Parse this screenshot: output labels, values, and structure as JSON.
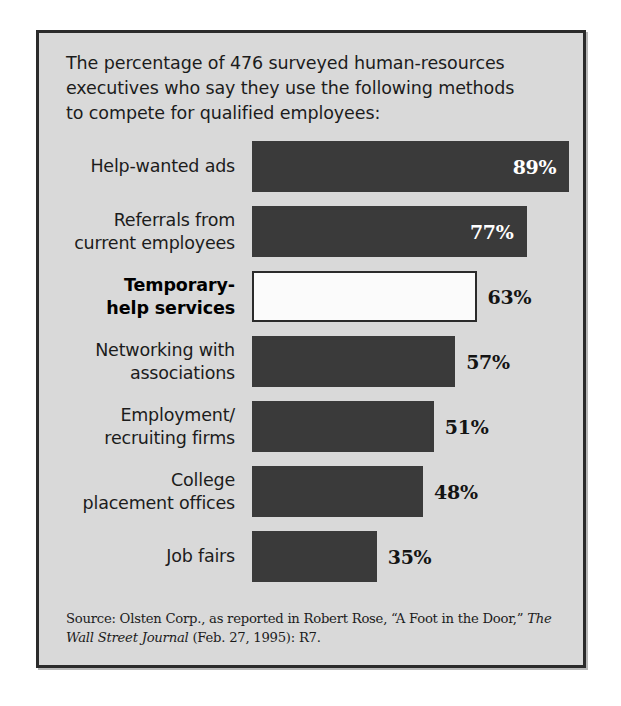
{
  "figure": {
    "caption": "The percentage of 476 surveyed human-resources executives who say they use the following methods to compete for qualified employees:",
    "source_line1": "Source: Olsten Corp., as reported in Robert Rose, “A Foot in the Door,”",
    "source_italic": "The Wall Street Journal",
    "source_line2_rest": " (Feb. 27, 1995): R7.",
    "colors": {
      "panel_background": "#d9d9d9",
      "panel_border": "#2b2b2b",
      "bar_fill": "#3a3a3a",
      "bar_highlight_fill": "#fbfbfb",
      "bar_highlight_border": "#2b2b2b",
      "value_label_inside": "#ffffff",
      "value_label_outside": "#141414",
      "text": "#1c1c1c"
    }
  },
  "chart_data": {
    "type": "bar",
    "orientation": "horizontal",
    "title": "The percentage of 476 surveyed human-resources executives who say they use the following methods to compete for qualified employees:",
    "xlabel": "",
    "ylabel": "",
    "xlim": [
      0,
      100
    ],
    "grid": false,
    "legend": null,
    "value_suffix": "%",
    "categories": [
      "Help-wanted ads",
      "Referrals from current employees",
      "Temporary-help services",
      "Networking with associations",
      "Employment/recruiting firms",
      "College placement offices",
      "Job fairs"
    ],
    "values": [
      89,
      77,
      63,
      57,
      51,
      48,
      35
    ],
    "bars": [
      {
        "label_lines": [
          "Help-wanted ads"
        ],
        "value": 89,
        "value_label": "89%",
        "highlight": false,
        "label_position": "inside"
      },
      {
        "label_lines": [
          "Referrals from",
          "current employees"
        ],
        "value": 77,
        "value_label": "77%",
        "highlight": false,
        "label_position": "inside"
      },
      {
        "label_lines": [
          "Temporary-",
          "help services"
        ],
        "value": 63,
        "value_label": "63%",
        "highlight": true,
        "label_position": "outside"
      },
      {
        "label_lines": [
          "Networking with",
          "associations"
        ],
        "value": 57,
        "value_label": "57%",
        "highlight": false,
        "label_position": "outside"
      },
      {
        "label_lines": [
          "Employment/",
          "recruiting firms"
        ],
        "value": 51,
        "value_label": "51%",
        "highlight": false,
        "label_position": "outside"
      },
      {
        "label_lines": [
          "College",
          "placement offices"
        ],
        "value": 48,
        "value_label": "48%",
        "highlight": false,
        "label_position": "outside"
      },
      {
        "label_lines": [
          "Job fairs"
        ],
        "value": 35,
        "value_label": "35%",
        "highlight": false,
        "label_position": "outside"
      }
    ]
  }
}
